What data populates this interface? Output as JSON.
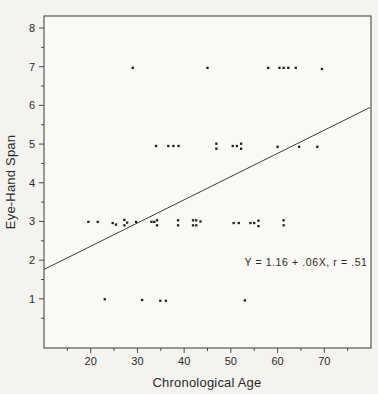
{
  "figure": {
    "background": "#f4f3f0",
    "plot_background": "#faf9f6",
    "ink": "#2b2b2b",
    "frame_color": "#4a4a4a",
    "point_color": "#1f1f1f",
    "line_color": "#3c3c3c"
  },
  "chart_data": {
    "type": "scatter",
    "title": "",
    "xlabel": "Chronological Age",
    "ylabel": "Eye-Hand Span",
    "xlim": [
      10,
      80
    ],
    "ylim": [
      -0.27,
      8.31
    ],
    "x_major_ticks": [
      20,
      30,
      40,
      50,
      60,
      70
    ],
    "x_minor_ticks": [
      15,
      25,
      35,
      45,
      55,
      65,
      75
    ],
    "y_major_ticks": [
      1,
      2,
      3,
      4,
      5,
      6,
      7,
      8
    ],
    "y_minor_ticks": [
      0.5,
      1.5,
      2.5,
      3.5,
      4.5,
      5.5,
      6.5,
      7.5
    ],
    "grid": false,
    "legend": null,
    "annotation": "Y = 1.16 + .06X, r = .51",
    "regression_line": {
      "intercept": 1.16,
      "slope": 0.06,
      "x_start": 10,
      "x_end": 79.8
    },
    "points": [
      [
        29,
        6.97
      ],
      [
        45,
        6.97
      ],
      [
        58,
        6.97
      ],
      [
        60.4,
        6.97
      ],
      [
        61.3,
        6.97
      ],
      [
        62.3,
        6.97
      ],
      [
        63.9,
        6.97
      ],
      [
        69.5,
        6.94
      ],
      [
        34,
        4.95
      ],
      [
        36.6,
        4.95
      ],
      [
        37.7,
        4.95
      ],
      [
        38.8,
        4.95
      ],
      [
        46.9,
        5.01
      ],
      [
        46.9,
        4.88
      ],
      [
        50.4,
        4.95
      ],
      [
        51.3,
        4.95
      ],
      [
        52.2,
        5.01
      ],
      [
        52.2,
        4.88
      ],
      [
        60,
        4.93
      ],
      [
        64.6,
        4.93
      ],
      [
        68.5,
        4.93
      ],
      [
        19.5,
        2.99
      ],
      [
        21.5,
        2.99
      ],
      [
        24.7,
        2.96
      ],
      [
        25.4,
        2.92
      ],
      [
        27.2,
        3.04
      ],
      [
        27.2,
        2.9
      ],
      [
        27.8,
        2.97
      ],
      [
        29.7,
        2.99
      ],
      [
        33,
        2.99
      ],
      [
        33.6,
        2.99
      ],
      [
        34.2,
        3.03
      ],
      [
        34.2,
        2.9
      ],
      [
        38.7,
        3.03
      ],
      [
        38.7,
        2.9
      ],
      [
        41.9,
        3.03
      ],
      [
        41.9,
        2.9
      ],
      [
        42.6,
        3.03
      ],
      [
        42.6,
        2.9
      ],
      [
        43.5,
        3.0
      ],
      [
        50.6,
        2.96
      ],
      [
        51.7,
        2.96
      ],
      [
        54.2,
        2.96
      ],
      [
        55,
        2.96
      ],
      [
        55.9,
        3.02
      ],
      [
        55.9,
        2.88
      ],
      [
        61.3,
        3.03
      ],
      [
        61.3,
        2.9
      ],
      [
        23,
        0.99
      ],
      [
        31,
        0.97
      ],
      [
        34.9,
        0.95
      ],
      [
        36.1,
        0.95
      ],
      [
        53,
        0.96
      ]
    ]
  }
}
